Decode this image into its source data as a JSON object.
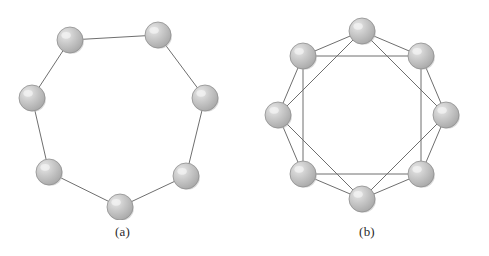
{
  "figure": {
    "background_color": "#ffffff",
    "panels": [
      {
        "id": "panel-a",
        "caption": "(a)",
        "graph": {
          "topology": "ring",
          "node_count": 7,
          "degree": 2,
          "center": {
            "x": 118,
            "y": 118
          },
          "radius": 86,
          "node_radius": 13,
          "start_angle_deg": -115.7,
          "neighbor_steps": [
            1
          ],
          "nodes": [
            {
              "index": 0,
              "label": "",
              "x": 70,
              "y": 40
            },
            {
              "index": 1,
              "label": "",
              "x": 158,
              "y": 35
            },
            {
              "index": 2,
              "label": "",
              "x": 205,
              "y": 98
            },
            {
              "index": 3,
              "label": "",
              "x": 186,
              "y": 176
            },
            {
              "index": 4,
              "label": "",
              "x": 120,
              "y": 207
            },
            {
              "index": 5,
              "label": "",
              "x": 49,
              "y": 172
            },
            {
              "index": 6,
              "label": "",
              "x": 32,
              "y": 98
            }
          ],
          "edges": [
            {
              "from": 0,
              "to": 1
            },
            {
              "from": 1,
              "to": 2
            },
            {
              "from": 2,
              "to": 3
            },
            {
              "from": 3,
              "to": 4
            },
            {
              "from": 4,
              "to": 5
            },
            {
              "from": 5,
              "to": 6
            },
            {
              "from": 6,
              "to": 0
            }
          ]
        }
      },
      {
        "id": "panel-b",
        "caption": "(b)",
        "graph": {
          "topology": "chordal-ring",
          "node_count": 8,
          "degree": 4,
          "center": {
            "x": 117,
            "y": 115
          },
          "radius": 84,
          "node_radius": 13,
          "start_angle_deg": -90,
          "neighbor_steps": [
            1,
            2
          ],
          "nodes": [
            {
              "index": 0,
              "label": "",
              "x": 117,
              "y": 31
            },
            {
              "index": 1,
              "label": "",
              "x": 176,
              "y": 56
            },
            {
              "index": 2,
              "label": "",
              "x": 201,
              "y": 115
            },
            {
              "index": 3,
              "label": "",
              "x": 176,
              "y": 174
            },
            {
              "index": 4,
              "label": "",
              "x": 117,
              "y": 199
            },
            {
              "index": 5,
              "label": "",
              "x": 58,
              "y": 174
            },
            {
              "index": 6,
              "label": "",
              "x": 33,
              "y": 115
            },
            {
              "index": 7,
              "label": "",
              "x": 58,
              "y": 56
            }
          ],
          "edges": [
            {
              "from": 0,
              "to": 1
            },
            {
              "from": 1,
              "to": 2
            },
            {
              "from": 2,
              "to": 3
            },
            {
              "from": 3,
              "to": 4
            },
            {
              "from": 4,
              "to": 5
            },
            {
              "from": 5,
              "to": 6
            },
            {
              "from": 6,
              "to": 7
            },
            {
              "from": 7,
              "to": 0
            },
            {
              "from": 0,
              "to": 2
            },
            {
              "from": 1,
              "to": 3
            },
            {
              "from": 2,
              "to": 4
            },
            {
              "from": 3,
              "to": 5
            },
            {
              "from": 4,
              "to": 6
            },
            {
              "from": 5,
              "to": 7
            },
            {
              "from": 6,
              "to": 0
            },
            {
              "from": 7,
              "to": 1
            }
          ]
        }
      }
    ],
    "style": {
      "edge_color": "#6f6f6f",
      "edge_width": 1,
      "node_fill_light": "#e8e8e8",
      "node_fill_mid": "#c9c9c9",
      "node_fill_dark": "#a6a6a6",
      "node_stroke": "#8f8f8f",
      "caption_color": "#2b2b2b"
    }
  }
}
